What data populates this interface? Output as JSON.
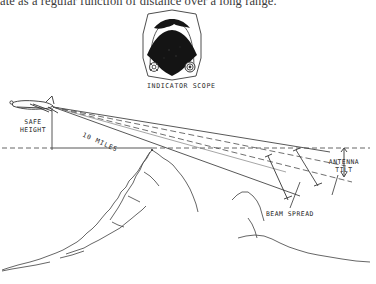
{
  "page": {
    "caption": "ate as a regular function of distance over a long range.",
    "background_color": "#ffffff",
    "ink_color": "#262626"
  },
  "indicator_scope": {
    "label": "INDICATOR SCOPE",
    "housing_shape": "octagon",
    "display_color": "#141414",
    "knobs": [
      {
        "name": "left-knob",
        "style": "cloverleaf"
      },
      {
        "name": "right-knob",
        "style": "concentric-rings"
      }
    ]
  },
  "diagram": {
    "labels": {
      "safe_height": "SAFE\nHEIGHT",
      "safe_height_line1": "SAFE",
      "safe_height_line2": "HEIGHT",
      "range": "10 MILES",
      "antenna_tilt_line1": "ANTENNA",
      "antenna_tilt_line2": "TILT",
      "beam_spread": "BEAM SPREAD"
    },
    "aircraft": {
      "name": "airplane-silhouette",
      "position": "upper-left"
    },
    "terrain": {
      "name": "mountain-profile",
      "style": "line-art-sketch"
    },
    "reference_line": {
      "name": "horizontal-datum",
      "style": "dashed"
    }
  }
}
